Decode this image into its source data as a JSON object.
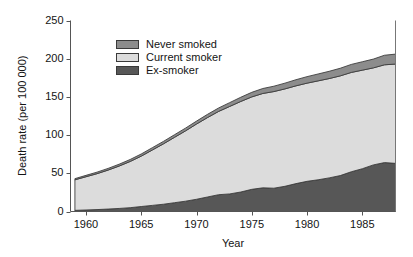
{
  "chart_data": {
    "type": "area",
    "stacked": true,
    "title": "",
    "xlabel": "Year",
    "ylabel": "Death rate (per 100 000)",
    "xlim": [
      1958.6,
      1988.0
    ],
    "ylim": [
      0,
      250
    ],
    "xticks": [
      1960,
      1965,
      1970,
      1975,
      1980,
      1985
    ],
    "yticks": [
      0,
      50,
      100,
      150,
      200,
      250
    ],
    "grid": false,
    "legend_position": "upper-left-inside",
    "x": [
      1959,
      1960,
      1961,
      1962,
      1963,
      1964,
      1965,
      1966,
      1967,
      1968,
      1969,
      1970,
      1971,
      1972,
      1973,
      1974,
      1975,
      1976,
      1977,
      1978,
      1979,
      1980,
      1981,
      1982,
      1983,
      1984,
      1985,
      1986,
      1987,
      1988
    ],
    "series": [
      {
        "name": "Ex-smoker",
        "color": "#575757",
        "stack_order": 1,
        "values": [
          1.5,
          2.0,
          2.5,
          3.2,
          4.0,
          5.0,
          6.5,
          8.0,
          9.5,
          11.5,
          13.5,
          16.0,
          19.0,
          22.0,
          23.0,
          25.5,
          29.0,
          31.0,
          30.5,
          33.0,
          36.5,
          39.5,
          41.5,
          44.0,
          47.0,
          52.0,
          56.0,
          61.0,
          64.0,
          63.0
        ]
      },
      {
        "name": "Current smoker",
        "color": "#dcdcdc",
        "stack_order": 2,
        "values": [
          40.0,
          43.5,
          47.0,
          51.0,
          55.5,
          60.5,
          66.0,
          72.5,
          79.0,
          85.5,
          92.0,
          98.5,
          104.0,
          109.0,
          114.5,
          118.5,
          121.0,
          123.5,
          126.5,
          127.5,
          128.0,
          128.5,
          129.5,
          130.0,
          130.5,
          130.0,
          129.0,
          127.0,
          128.0,
          130.0
        ]
      },
      {
        "name": "Never smoked",
        "color": "#8c8c8c",
        "stack_order": 3,
        "values": [
          1.5,
          1.8,
          2.0,
          2.2,
          2.4,
          2.6,
          2.8,
          3.0,
          3.2,
          3.4,
          3.6,
          3.8,
          4.2,
          4.5,
          5.0,
          5.5,
          6.0,
          6.5,
          7.0,
          7.5,
          8.0,
          8.5,
          9.0,
          9.5,
          10.0,
          10.5,
          11.0,
          11.5,
          12.5,
          13.0
        ]
      }
    ],
    "totals": [
      43.0,
      47.3,
      51.5,
      56.4,
      61.9,
      68.1,
      75.3,
      83.5,
      91.7,
      100.4,
      109.1,
      118.3,
      127.2,
      135.5,
      142.5,
      149.5,
      156.0,
      161.0,
      164.0,
      168.0,
      172.5,
      176.5,
      180.0,
      183.5,
      187.5,
      192.5,
      196.0,
      199.5,
      204.5,
      206.0
    ]
  },
  "legend": {
    "items": [
      {
        "label": "Never smoked",
        "color": "#8c8c8c"
      },
      {
        "label": "Current smoker",
        "color": "#dcdcdc"
      },
      {
        "label": "Ex-smoker",
        "color": "#575757"
      }
    ]
  },
  "axes": {
    "y_label": "Death rate (per 100 000)",
    "x_label": "Year",
    "y_tick_labels": [
      "250",
      "200",
      "150",
      "100",
      "50",
      "0"
    ],
    "x_tick_labels": [
      "1960",
      "1965",
      "1970",
      "1975",
      "1980",
      "1985"
    ]
  }
}
